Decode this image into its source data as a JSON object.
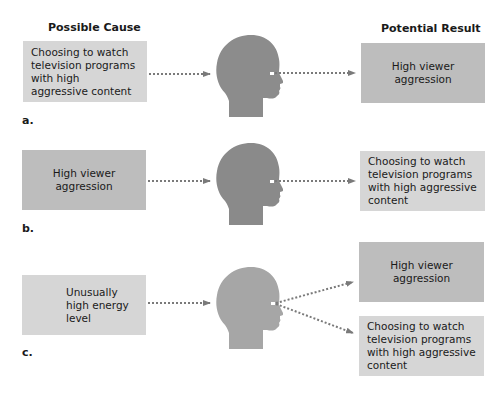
{
  "headers": {
    "cause": "Possible Cause",
    "result": "Potential Result"
  },
  "panels": [
    {
      "label": "a.",
      "cause": "Choosing to watch television programs with high aggressive content",
      "results": [
        "High viewer aggression"
      ]
    },
    {
      "label": "b.",
      "cause": "High viewer aggression",
      "results": [
        "Choosing to watch television programs with high aggressive content"
      ]
    },
    {
      "label": "c.",
      "cause": "Unusually high energy level",
      "results": [
        "High viewer aggression",
        "Choosing to watch television programs with high aggressive content"
      ]
    }
  ],
  "colors": {
    "box_light": "#d6d6d6",
    "box_dark": "#bdbdbd",
    "head_dark": "#8c8c8c",
    "head_light": "#a6a6a6",
    "arrow": "#7a7a7a"
  }
}
